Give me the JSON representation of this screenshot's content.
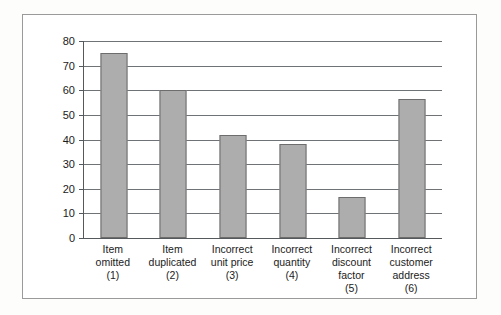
{
  "chart_data": {
    "type": "bar",
    "title": "",
    "subtitle": "",
    "xlabel": "",
    "ylabel": "",
    "ylim": [
      0,
      80
    ],
    "ytick_step": 10,
    "yticks": [
      80,
      70,
      60,
      50,
      40,
      30,
      20,
      10,
      0
    ],
    "grid": true,
    "legend": false,
    "categories": [
      "Item omitted (1)",
      "Item duplicated (2)",
      "Incorrect unit price (3)",
      "Incorrect quantity (4)",
      "Incorrect discount factor (5)",
      "Incorrect customer address (6)"
    ],
    "category_lines": [
      [
        "Item",
        "omitted",
        "(1)"
      ],
      [
        "Item",
        "duplicated",
        "(2)"
      ],
      [
        "Incorrect",
        "unit price",
        "(3)"
      ],
      [
        "Incorrect",
        "quantity",
        "(4)"
      ],
      [
        "Incorrect",
        "discount",
        "factor",
        "(5)"
      ],
      [
        "Incorrect",
        "customer",
        "address",
        "(6)"
      ]
    ],
    "values": [
      75,
      60,
      42,
      38,
      16.5,
      56.5
    ],
    "bar_color": "#adadad",
    "bar_border_color": "#6d6d6d",
    "gridline_color": "#6f7376",
    "axis_color": "#55595c",
    "frame_color": "#9a9a9a",
    "plot_background": "#ffffff"
  }
}
